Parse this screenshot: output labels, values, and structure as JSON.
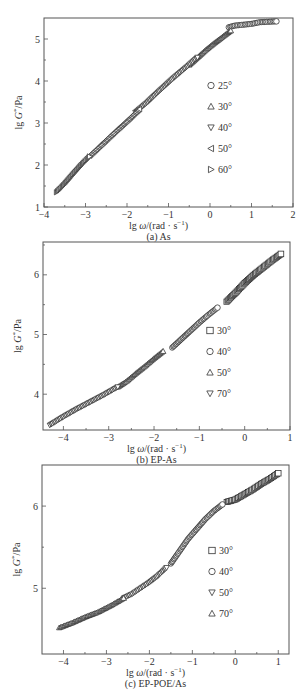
{
  "chart_data": [
    {
      "type": "scatter",
      "panel": "a",
      "caption": "(a) As",
      "xlabel": "lg ω/(rad · s⁻¹)",
      "ylabel": "lg G*/Pa",
      "xlim": [
        -4,
        2
      ],
      "ylim": [
        1,
        5.5
      ],
      "xticks": [
        -4,
        -3,
        -2,
        -1,
        0,
        1,
        2
      ],
      "yticks": [
        1,
        2,
        3,
        4,
        5
      ],
      "grid": false,
      "legend_position": "inside-right",
      "series": [
        {
          "name": "25°",
          "marker": "circle",
          "x": [
            0.45,
            0.6,
            0.8,
            1.0,
            1.2,
            1.4,
            1.6
          ],
          "y": [
            5.28,
            5.32,
            5.34,
            5.36,
            5.4,
            5.41,
            5.42
          ]
        },
        {
          "name": "30°",
          "marker": "triangle-up",
          "x": [
            -0.5,
            -0.3,
            -0.1,
            0.1,
            0.3,
            0.5
          ],
          "y": [
            4.38,
            4.56,
            4.74,
            4.9,
            5.05,
            5.2
          ]
        },
        {
          "name": "40°",
          "marker": "triangle-down",
          "x": [
            -1.8,
            -1.5,
            -1.2,
            -0.9,
            -0.6,
            -0.3
          ],
          "y": [
            3.25,
            3.5,
            3.78,
            4.05,
            4.3,
            4.56
          ]
        },
        {
          "name": "50°",
          "marker": "triangle-left",
          "x": [
            -2.9,
            -2.6,
            -2.3,
            -2.0,
            -1.7
          ],
          "y": [
            2.22,
            2.5,
            2.78,
            3.05,
            3.33
          ]
        },
        {
          "name": "60°",
          "marker": "triangle-right",
          "x": [
            -3.7,
            -3.5,
            -3.3,
            -3.1,
            -2.9
          ],
          "y": [
            1.35,
            1.55,
            1.78,
            2.0,
            2.2
          ]
        }
      ]
    },
    {
      "type": "scatter",
      "panel": "b",
      "caption": "(b) EP-As",
      "xlabel": "lg ω/(rad · s⁻¹)",
      "ylabel": "lg G*/Pa",
      "xlim": [
        -4.45,
        1
      ],
      "ylim": [
        3.4,
        6.55
      ],
      "xticks": [
        -4,
        -3,
        -2,
        -1,
        0,
        1
      ],
      "yticks": [
        4,
        5,
        6
      ],
      "grid": false,
      "legend_position": "inside-right",
      "series": [
        {
          "name": "30°",
          "marker": "square",
          "x": [
            -0.4,
            -0.2,
            0.0,
            0.2,
            0.4,
            0.6,
            0.8
          ],
          "y": [
            5.55,
            5.7,
            5.86,
            6.0,
            6.12,
            6.24,
            6.35
          ]
        },
        {
          "name": "40°",
          "marker": "circle",
          "x": [
            -1.6,
            -1.4,
            -1.2,
            -1.0,
            -0.8,
            -0.6
          ],
          "y": [
            4.78,
            4.92,
            5.06,
            5.2,
            5.33,
            5.45
          ]
        },
        {
          "name": "50°",
          "marker": "triangle-up",
          "x": [
            -2.8,
            -2.6,
            -2.4,
            -2.2,
            -2.0,
            -1.8
          ],
          "y": [
            4.12,
            4.22,
            4.35,
            4.47,
            4.6,
            4.72
          ]
        },
        {
          "name": "70°",
          "marker": "triangle-down",
          "x": [
            -4.3,
            -4.0,
            -3.7,
            -3.4,
            -3.1,
            -2.8
          ],
          "y": [
            3.48,
            3.62,
            3.75,
            3.87,
            3.99,
            4.12
          ]
        }
      ]
    },
    {
      "type": "scatter",
      "panel": "c",
      "caption": "(c) EP-POE/As",
      "xlabel": "lg ω/(rad · s⁻¹)",
      "ylabel": "lg G*/Pa",
      "xlim": [
        -4.5,
        1.25
      ],
      "ylim": [
        4.2,
        6.5
      ],
      "xticks": [
        -4,
        -3,
        -2,
        -1,
        0,
        1
      ],
      "yticks": [
        5,
        6
      ],
      "grid": false,
      "legend_position": "inside-right",
      "series": [
        {
          "name": "30°",
          "marker": "square",
          "x": [
            -0.2,
            0.0,
            0.2,
            0.4,
            0.6,
            0.8,
            1.0
          ],
          "y": [
            6.05,
            6.08,
            6.14,
            6.2,
            6.27,
            6.33,
            6.4
          ]
        },
        {
          "name": "40°",
          "marker": "circle",
          "x": [
            -1.5,
            -1.3,
            -1.1,
            -0.9,
            -0.7,
            -0.5,
            -0.3
          ],
          "y": [
            5.3,
            5.45,
            5.6,
            5.72,
            5.84,
            5.94,
            6.02
          ]
        },
        {
          "name": "50°",
          "marker": "triangle-down",
          "x": [
            -2.6,
            -2.4,
            -2.2,
            -2.0,
            -1.8,
            -1.6
          ],
          "y": [
            4.88,
            4.93,
            5.0,
            5.07,
            5.15,
            5.25
          ]
        },
        {
          "name": "70°",
          "marker": "triangle-up",
          "x": [
            -4.1,
            -3.8,
            -3.5,
            -3.2,
            -2.9,
            -2.6
          ],
          "y": [
            4.52,
            4.58,
            4.65,
            4.71,
            4.79,
            4.88
          ]
        }
      ]
    }
  ],
  "panels": [
    {
      "frame": {
        "left": 44,
        "top": 18,
        "right": 293,
        "bottom": 207
      },
      "legend": {
        "x": 211,
        "y0": 89,
        "dy": 21
      }
    },
    {
      "frame": {
        "left": 43,
        "top": 242,
        "right": 290,
        "bottom": 430
      },
      "legend": {
        "x": 210,
        "y0": 334,
        "dy": 21
      }
    },
    {
      "frame": {
        "left": 42,
        "top": 465,
        "right": 289,
        "bottom": 654
      },
      "legend": {
        "x": 212,
        "y0": 554,
        "dy": 21
      }
    }
  ],
  "labels": {
    "xlabel_prefix": "lg ",
    "xlabel_omega": "ω",
    "xlabel_suffix": "/(rad · s",
    "xlabel_exp": "−1",
    "xlabel_close": ")",
    "ylabel_prefix": "lg ",
    "ylabel_G": "G",
    "ylabel_star": "*",
    "ylabel_suffix": "/Pa"
  }
}
